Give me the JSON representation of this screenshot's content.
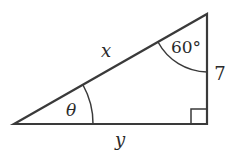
{
  "diagram": {
    "type": "right-triangle",
    "colors": {
      "stroke": "#3a3a3a",
      "text": "#2a2a2a",
      "background": "#ffffff"
    },
    "vertices": {
      "left": [
        14,
        124
      ],
      "top": [
        207,
        14
      ],
      "right_angle": [
        207,
        124
      ]
    },
    "labels": {
      "hypotenuse": "x",
      "base": "y",
      "vertical_side": "7",
      "top_angle": "60°",
      "left_angle": "θ"
    },
    "right_angle_marker": true
  }
}
